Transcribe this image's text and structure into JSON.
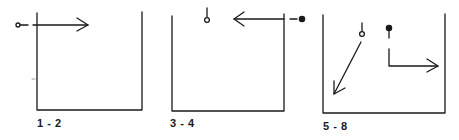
{
  "figure": {
    "colors": {
      "ink": "#1a1a1a",
      "faint": "#9a9a9a",
      "background": "#ffffff"
    },
    "panels": [
      {
        "id": "panel-1-2",
        "label": "1 - 2",
        "elements": [
          "open-pin-left",
          "arrow-right",
          "open-top-box"
        ]
      },
      {
        "id": "panel-3-4",
        "label": "3 - 4",
        "elements": [
          "open-pin-top",
          "arrow-left",
          "filled-pin-right",
          "open-top-box"
        ]
      },
      {
        "id": "panel-5-8",
        "label": "5 - 8",
        "elements": [
          "open-pin-top",
          "arrow-down-left",
          "filled-pin-top",
          "arrow-down-then-right",
          "open-top-box"
        ]
      }
    ]
  }
}
